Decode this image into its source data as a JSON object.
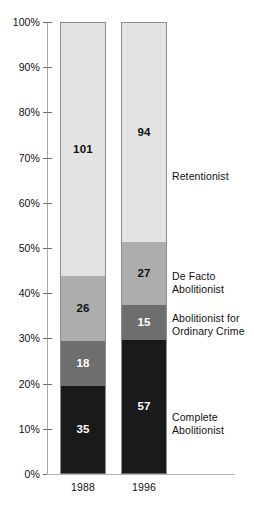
{
  "chart_data": {
    "type": "bar",
    "subtype": "100% stacked column",
    "title": "",
    "subtitle": "",
    "xlabel": "",
    "ylabel": "",
    "categories": [
      "1988",
      "1996"
    ],
    "ylim": [
      0,
      100
    ],
    "y_unit": "%",
    "y_ticks": [
      "0%",
      "10%",
      "20%",
      "30%",
      "40%",
      "50%",
      "60%",
      "70%",
      "80%",
      "90%",
      "100%"
    ],
    "y_tick_values": [
      0,
      10,
      20,
      30,
      40,
      50,
      60,
      70,
      80,
      90,
      100
    ],
    "grid": false,
    "legend_position": "right-inline",
    "series": [
      {
        "name": "Complete Abolitionist",
        "color": "#1a1a1a",
        "values": [
          35,
          57
        ],
        "percents": [
          19.4,
          29.5
        ],
        "label_color": "#ffffff"
      },
      {
        "name": "Abolitionist for Ordinary Crime",
        "color": "#6e6e6e",
        "values": [
          18,
          15
        ],
        "percents": [
          10.0,
          7.8
        ],
        "label_color": "#ffffff"
      },
      {
        "name": "De Facto Abolitionist",
        "color": "#adadad",
        "values": [
          26,
          27
        ],
        "percents": [
          14.4,
          14.0
        ],
        "label_color": "#111111"
      },
      {
        "name": "Retentionist",
        "color": "#e3e3e3",
        "values": [
          101,
          94
        ],
        "percents": [
          56.1,
          48.7
        ],
        "label_color": "#111111"
      }
    ],
    "totals": [
      180,
      193
    ]
  },
  "axis": {
    "y_ticks": [
      "100%",
      "90%",
      "80%",
      "70%",
      "60%",
      "50%",
      "40%",
      "30%",
      "20%",
      "10%",
      "0%"
    ],
    "x_ticks": [
      "1988",
      "1996"
    ]
  },
  "bars": [
    {
      "category": "1988",
      "segments": [
        {
          "name": "Retentionist",
          "value": "101",
          "top_pct": 0.0,
          "height_pct": 56.11
        },
        {
          "name": "De Facto Abolitionist",
          "value": "26",
          "top_pct": 56.11,
          "height_pct": 14.44
        },
        {
          "name": "Abolitionist for Ordinary Crime",
          "value": "18",
          "top_pct": 70.55,
          "height_pct": 10.0
        },
        {
          "name": "Complete Abolitionist",
          "value": "35",
          "top_pct": 80.55,
          "height_pct": 19.45
        }
      ]
    },
    {
      "category": "1996",
      "segments": [
        {
          "name": "Retentionist",
          "value": "94",
          "top_pct": 0.0,
          "height_pct": 48.7
        },
        {
          "name": "De Facto Abolitionist",
          "value": "27",
          "top_pct": 48.7,
          "height_pct": 13.99
        },
        {
          "name": "Abolitionist for Ordinary Crime",
          "value": "15",
          "top_pct": 62.69,
          "height_pct": 7.77
        },
        {
          "name": "Complete Abolitionist",
          "value": "57",
          "top_pct": 70.46,
          "height_pct": 29.54
        }
      ]
    }
  ],
  "legend": [
    {
      "key": "retentionist",
      "line1": "Retentionist",
      "line2": "",
      "top_px": 170
    },
    {
      "key": "de-facto",
      "line1": "De Facto",
      "line2": "Abolitionist",
      "top_px": 270
    },
    {
      "key": "ordinary-crime",
      "line1": "Abolitionist for",
      "line2": "Ordinary Crime",
      "top_px": 312
    },
    {
      "key": "complete",
      "line1": "Complete",
      "line2": "Abolitionist",
      "top_px": 411
    }
  ],
  "colors": {
    "retentionist": "#e3e3e3",
    "de_facto_abolitionist": "#adadad",
    "abolitionist_ordinary_crime": "#6e6e6e",
    "complete_abolitionist": "#1a1a1a",
    "axis": "#a9a9a9",
    "text": "#111111"
  }
}
